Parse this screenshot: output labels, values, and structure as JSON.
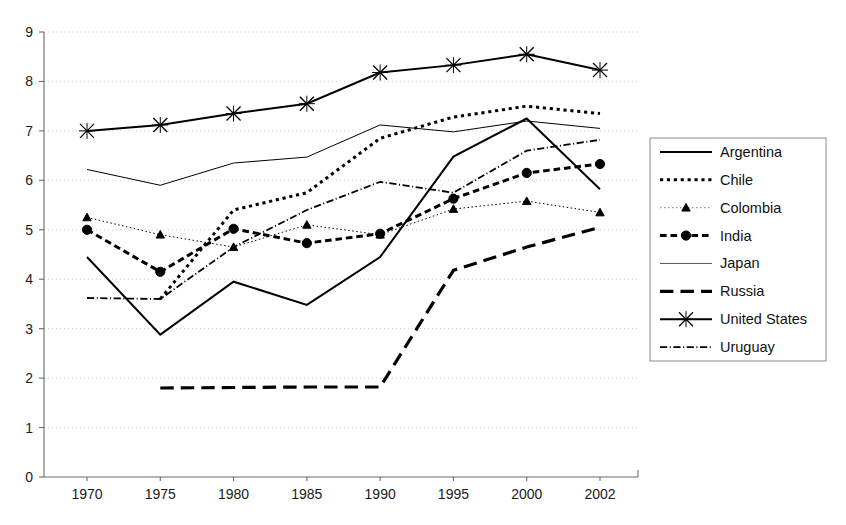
{
  "chart_data": {
    "type": "line",
    "title": "",
    "subtitle": "",
    "xlabel": "",
    "ylabel": "",
    "x": [
      "1970",
      "1975",
      "1980",
      "1985",
      "1990",
      "1995",
      "2000",
      "2002"
    ],
    "categories": [
      "1970",
      "1975",
      "1980",
      "1985",
      "1990",
      "1995",
      "2000",
      "2002"
    ],
    "xtick_labels": [
      "1970",
      "1975",
      "1980",
      "1985",
      "1990",
      "1995",
      "2000",
      "2002"
    ],
    "ytick_labels": [
      "0",
      "1",
      "2",
      "3",
      "4",
      "5",
      "6",
      "7",
      "8",
      "9"
    ],
    "ylim": [
      0,
      9
    ],
    "ytick_step": 1,
    "grid": true,
    "grid_axis": "y",
    "legend_position": "right",
    "series": [
      {
        "name": "Argentina",
        "style": "solid",
        "marker": "none",
        "width": 2.0,
        "values": [
          4.45,
          2.88,
          3.95,
          3.48,
          4.45,
          6.48,
          7.25,
          5.82
        ]
      },
      {
        "name": "Chile",
        "style": "dotted",
        "marker": "none",
        "width": 3.0,
        "values": [
          null,
          3.6,
          5.4,
          5.75,
          6.85,
          7.28,
          7.5,
          7.35
        ]
      },
      {
        "name": "Colombia",
        "style": "thin-dotted",
        "marker": "triangle",
        "width": 1.0,
        "values": [
          5.25,
          4.9,
          4.65,
          5.1,
          4.9,
          5.42,
          5.58,
          5.35
        ]
      },
      {
        "name": "India",
        "style": "dash-short",
        "marker": "circle",
        "width": 3.0,
        "values": [
          5.0,
          4.15,
          5.02,
          4.73,
          4.92,
          5.63,
          6.15,
          6.33
        ]
      },
      {
        "name": "Japan",
        "style": "thin-solid",
        "marker": "none",
        "width": 1.0,
        "values": [
          6.22,
          5.9,
          6.35,
          6.47,
          7.12,
          6.98,
          7.2,
          7.05
        ]
      },
      {
        "name": "Russia",
        "style": "dash-long",
        "marker": "none",
        "width": 3.2,
        "values": [
          null,
          1.8,
          1.81,
          1.82,
          1.82,
          4.18,
          4.65,
          5.05
        ]
      },
      {
        "name": "United States",
        "style": "solid",
        "marker": "x",
        "width": 2.0,
        "values": [
          7.0,
          7.12,
          7.35,
          7.55,
          8.18,
          8.33,
          8.55,
          8.23
        ]
      },
      {
        "name": "Uruguay",
        "style": "dash-dot",
        "marker": "none",
        "width": 1.8,
        "values": [
          3.62,
          3.6,
          4.65,
          5.4,
          5.97,
          5.75,
          6.6,
          6.82
        ]
      }
    ]
  },
  "legend": {
    "items": [
      {
        "label": "Argentina"
      },
      {
        "label": "Chile"
      },
      {
        "label": "Colombia"
      },
      {
        "label": "India"
      },
      {
        "label": "Japan"
      },
      {
        "label": "Russia"
      },
      {
        "label": "United States"
      },
      {
        "label": "Uruguay"
      }
    ]
  },
  "colors": {
    "line": "#000000",
    "axis": "#6b6b6b",
    "grid": "#c9c9c9",
    "text": "#1a1a1a",
    "background": "#ffffff",
    "legend_border": "#8a8a8a"
  }
}
